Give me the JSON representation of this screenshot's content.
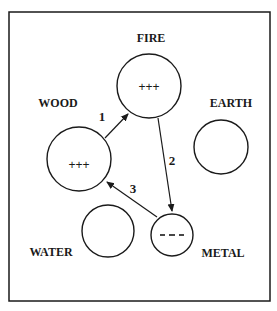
{
  "diagram": {
    "frame": {
      "x": 9,
      "y": 12,
      "width": 261,
      "height": 289
    },
    "stroke_color": "#1a1a1a",
    "nodes": [
      {
        "id": "fire",
        "label": "FIRE",
        "charge": "+++",
        "cx": 149,
        "cy": 86,
        "r": 32,
        "label_x": 151,
        "label_y": 42
      },
      {
        "id": "wood",
        "label": "WOOD",
        "charge": "+++",
        "cx": 79,
        "cy": 159,
        "r": 32,
        "label_x": 58,
        "label_y": 107
      },
      {
        "id": "earth",
        "label": "EARTH",
        "charge": "",
        "cx": 221,
        "cy": 147,
        "r": 27,
        "label_x": 231,
        "label_y": 107
      },
      {
        "id": "water",
        "label": "WATER",
        "charge": "",
        "cx": 108,
        "cy": 231,
        "r": 26,
        "label_x": 51,
        "label_y": 256
      },
      {
        "id": "metal",
        "label": "METAL",
        "charge": "- - -",
        "cx": 172,
        "cy": 235,
        "r": 21,
        "label_x": 223,
        "label_y": 257
      }
    ],
    "edges": [
      {
        "label": "1",
        "from": "wood",
        "to": "fire",
        "x1": 105,
        "y1": 138,
        "x2": 128,
        "y2": 114,
        "label_x": 102,
        "label_y": 121
      },
      {
        "label": "2",
        "from": "fire",
        "to": "metal",
        "x1": 158,
        "y1": 118,
        "x2": 172,
        "y2": 211,
        "label_x": 172,
        "label_y": 165
      },
      {
        "label": "3",
        "from": "metal",
        "to": "wood",
        "x1": 157,
        "y1": 217,
        "x2": 107,
        "y2": 182,
        "label_x": 133,
        "label_y": 193
      }
    ]
  },
  "labels": {
    "fire": "FIRE",
    "wood": "WOOD",
    "earth": "EARTH",
    "water": "WATER",
    "metal": "METAL"
  },
  "charges": {
    "fire": "+++",
    "wood": "+++",
    "metal": "- - -"
  },
  "edge_labels": {
    "e1": "1",
    "e2": "2",
    "e3": "3"
  }
}
